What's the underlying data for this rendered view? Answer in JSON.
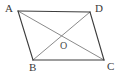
{
  "figure": {
    "kind": "geometry-diagram",
    "width": 126,
    "height": 82,
    "background_color": "#ffffff"
  },
  "styles": {
    "side_color": "#3d3d3d",
    "diagonal_color": "#7d7d7d",
    "side_width": 1.1,
    "diagonal_width": 0.9,
    "label_color": "#3a3a3a",
    "point_label_color": "#4a4a4a"
  },
  "points": {
    "A": {
      "label": "A",
      "x": 18,
      "y": 11,
      "label_x": 5,
      "label_y": 3
    },
    "D": {
      "label": "D",
      "x": 90,
      "y": 12,
      "label_x": 95,
      "label_y": 3
    },
    "B": {
      "label": "B",
      "x": 33,
      "y": 60,
      "label_x": 29,
      "label_y": 62
    },
    "C": {
      "label": "C",
      "x": 104,
      "y": 60,
      "label_x": 107,
      "label_y": 61
    },
    "O": {
      "label": "O",
      "x": 61,
      "y": 36,
      "label_x": 60,
      "label_y": 41
    }
  },
  "segments": [
    {
      "name": "side-AD",
      "from": "A",
      "to": "D",
      "role": "side"
    },
    {
      "name": "side-DC",
      "from": "D",
      "to": "C",
      "role": "side"
    },
    {
      "name": "side-CB",
      "from": "C",
      "to": "B",
      "role": "side"
    },
    {
      "name": "side-BA",
      "from": "B",
      "to": "A",
      "role": "side"
    },
    {
      "name": "diagonal-AC",
      "from": "A",
      "to": "C",
      "role": "diagonal"
    },
    {
      "name": "diagonal-BD",
      "from": "B",
      "to": "D",
      "role": "diagonal"
    }
  ]
}
